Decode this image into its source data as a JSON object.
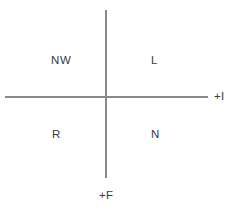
{
  "diagram": {
    "type": "four-quadrant-axes",
    "quadrants": [
      {
        "key": "upper_left",
        "label": "NW",
        "position": "upper-left"
      },
      {
        "key": "upper_right",
        "label": "L",
        "position": "upper-right"
      },
      {
        "key": "lower_left",
        "label": "R",
        "position": "lower-left"
      },
      {
        "key": "lower_right",
        "label": "N",
        "position": "lower-right"
      }
    ],
    "axes": {
      "horizontal": {
        "positive_label": "+I",
        "label_side": "right"
      },
      "vertical": {
        "positive_label": "+F",
        "label_side": "bottom"
      }
    },
    "colors": {
      "axis_line": "#8a8a8a",
      "text": "#3b3b3b",
      "background": "#ffffff"
    }
  }
}
